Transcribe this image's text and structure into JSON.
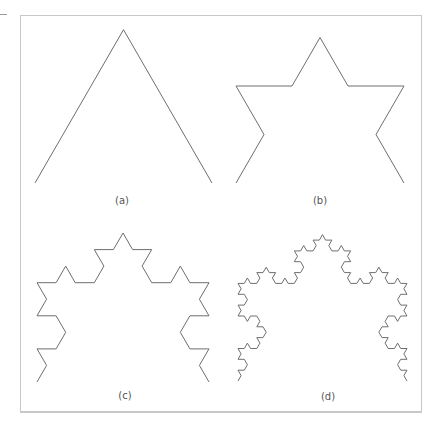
{
  "figure": {
    "stroke_color": "#6e6e6e",
    "frame_color": "#c8c8c8",
    "panels": [
      {
        "label": "(a)",
        "koch_level": 0,
        "base_left": [
          35,
          183
        ],
        "base_right": [
          212,
          183
        ],
        "label_pos": [
          122,
          200
        ]
      },
      {
        "label": "(b)",
        "koch_level": 1,
        "base_left": [
          236,
          183
        ],
        "base_right": [
          404,
          183
        ],
        "label_pos": [
          320,
          200
        ]
      },
      {
        "label": "(c)",
        "koch_level": 2,
        "base_left": [
          37,
          382
        ],
        "base_right": [
          209,
          382
        ],
        "label_pos": [
          125,
          395
        ]
      },
      {
        "label": "(d)",
        "koch_level": 3,
        "base_left": [
          238,
          381
        ],
        "base_right": [
          407,
          381
        ],
        "label_pos": [
          328,
          396
        ]
      }
    ]
  }
}
